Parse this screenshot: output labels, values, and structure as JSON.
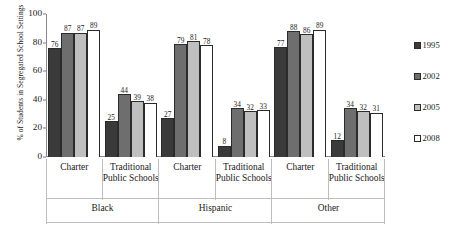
{
  "chart_data": {
    "type": "bar",
    "title": "",
    "subtitle": "",
    "xlabel": "",
    "ylabel": "% of Students in Segregated School Settings",
    "ylim": [
      0,
      100
    ],
    "yticks": [
      0,
      20,
      40,
      60,
      80,
      100
    ],
    "ytick_labels": [
      "0",
      "20",
      "40",
      "60",
      "80",
      "100"
    ],
    "grid": false,
    "legend_position": "right",
    "bar_value_labels": true,
    "categories": [
      "Charter",
      "Traditional Public Schools",
      "Charter",
      "Traditional Public Schools",
      "Charter",
      "Traditional Public Schools"
    ],
    "category_groups": [
      "Black",
      "Black",
      "Hispanic",
      "Hispanic",
      "Other",
      "Other"
    ],
    "series": [
      {
        "name": "1995",
        "color": "#3a3a3a",
        "values": [
          76,
          25,
          27,
          8,
          77,
          12
        ]
      },
      {
        "name": "2002",
        "color": "#6e6e6e",
        "values": [
          87,
          44,
          79,
          34,
          88,
          34
        ]
      },
      {
        "name": "2005",
        "color": "#bfbfbf",
        "values": [
          87,
          39,
          81,
          32,
          86,
          32
        ]
      },
      {
        "name": "2008",
        "color": "#ffffff",
        "values": [
          89,
          38,
          78,
          33,
          89,
          31
        ]
      }
    ]
  },
  "axis": {
    "y_title": "% of Students in Segregated School Settings",
    "y_tick_labels": [
      "100",
      "80",
      "60",
      "40",
      "20",
      "0"
    ]
  },
  "tier1": [
    {
      "label": "Charter"
    },
    {
      "label": "Traditional Public Schools"
    },
    {
      "label": "Charter"
    },
    {
      "label": "Traditional Public Schools"
    },
    {
      "label": "Charter"
    },
    {
      "label": "Traditional Public Schools"
    }
  ],
  "tier2": [
    {
      "label": "Black"
    },
    {
      "label": "Hispanic"
    },
    {
      "label": "Other"
    }
  ],
  "legend": {
    "items": [
      {
        "label": "1995",
        "color": "#3a3a3a"
      },
      {
        "label": "2002",
        "color": "#6e6e6e"
      },
      {
        "label": "2005",
        "color": "#bfbfbf"
      },
      {
        "label": "2008",
        "color": "#ffffff"
      }
    ]
  }
}
